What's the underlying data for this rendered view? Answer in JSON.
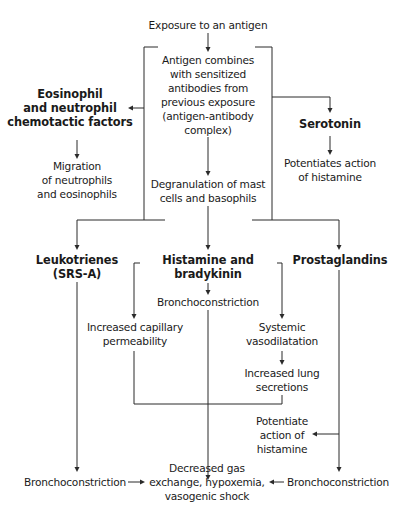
{
  "diagram": {
    "type": "flowchart",
    "nodes": {
      "exposure": "Exposure to an antigen",
      "antigen_combines": "Antigen combines\nwith sensitized\nantibodies from\nprevious exposure\n(antigen-antibody\ncomplex)",
      "eosinophil_factors": "Eosinophil\nand neutrophil\nchemotactic factors",
      "migration": "Migration\nof neutrophils\nand eosinophils",
      "serotonin": "Serotonin",
      "potentiates_action": "Potentiates action\nof histamine",
      "degranulation": "Degranulation of mast\ncells and basophils",
      "leukotrienes": "Leukotrienes\n(SRS-A)",
      "histamine_bradykinin": "Histamine and\nbradykinin",
      "prostaglandins": "Prostaglandins",
      "bronchoconstriction_center": "Bronchoconstriction",
      "increased_capillary": "Increased capillary\npermeability",
      "systemic_vasodilatation": "Systemic\nvasodilatation",
      "increased_lung": "Increased lung\nsecretions",
      "potentiate_histamine": "Potentiate\naction of\nhistamine",
      "bronchoconstriction_left": "Bronchoconstriction",
      "decreased_gas": "Decreased gas\nexchange, hypoxemia,\nvasogenic shock",
      "bronchoconstriction_right": "Bronchoconstriction"
    },
    "edges": [
      [
        "exposure",
        "antigen_combines"
      ],
      [
        "antigen_combines",
        "eosinophil_factors"
      ],
      [
        "antigen_combines",
        "serotonin"
      ],
      [
        "antigen_combines",
        "degranulation"
      ],
      [
        "eosinophil_factors",
        "migration"
      ],
      [
        "serotonin",
        "potentiates_action"
      ],
      [
        "degranulation",
        "leukotrienes"
      ],
      [
        "degranulation",
        "histamine_bradykinin"
      ],
      [
        "degranulation",
        "prostaglandins"
      ],
      [
        "histamine_bradykinin",
        "bronchoconstriction_center"
      ],
      [
        "histamine_bradykinin",
        "increased_capillary"
      ],
      [
        "histamine_bradykinin",
        "systemic_vasodilatation"
      ],
      [
        "systemic_vasodilatation",
        "increased_lung"
      ],
      [
        "bronchoconstriction_center",
        "decreased_gas"
      ],
      [
        "increased_capillary",
        "decreased_gas"
      ],
      [
        "increased_lung",
        "decreased_gas"
      ],
      [
        "leukotrienes",
        "bronchoconstriction_left"
      ],
      [
        "prostaglandins",
        "potentiate_histamine"
      ],
      [
        "prostaglandins",
        "bronchoconstriction_right"
      ],
      [
        "bronchoconstriction_left",
        "decreased_gas"
      ],
      [
        "bronchoconstriction_right",
        "decreased_gas"
      ]
    ],
    "colors": {
      "line": "#2a2a2a",
      "text": "#1a1a1a",
      "background": "#ffffff"
    }
  }
}
